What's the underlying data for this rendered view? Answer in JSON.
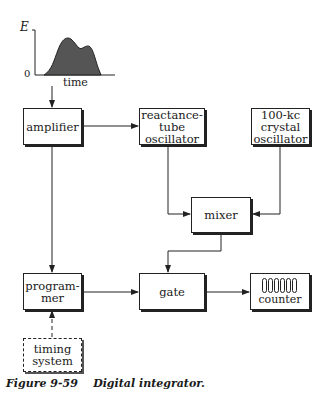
{
  "figure": {
    "caption_number": "Figure 9-59",
    "caption_title": "Digital integrator."
  },
  "input_graph": {
    "y_label": "E",
    "origin_label": "0",
    "x_label": "time",
    "fill_color": "#555555"
  },
  "blocks": {
    "amplifier": "amplifier",
    "reactance_osc": [
      "reactance-",
      "tube",
      "oscillator"
    ],
    "crystal_osc": [
      "100-kc",
      "crystal",
      "oscillator"
    ],
    "mixer": "mixer",
    "programmer": [
      "program-",
      "mer"
    ],
    "gate": "gate",
    "counter": "counter",
    "timing": [
      "timing",
      "system"
    ]
  },
  "counter_digits": 6,
  "connections": [
    {
      "from": "input_graph",
      "to": "amplifier",
      "style": "solid"
    },
    {
      "from": "amplifier",
      "to": "reactance_osc",
      "style": "solid"
    },
    {
      "from": "amplifier",
      "to": "programmer",
      "style": "solid"
    },
    {
      "from": "reactance_osc",
      "to": "mixer",
      "style": "solid"
    },
    {
      "from": "crystal_osc",
      "to": "mixer",
      "style": "solid"
    },
    {
      "from": "mixer",
      "to": "gate",
      "style": "solid"
    },
    {
      "from": "programmer",
      "to": "gate",
      "style": "solid"
    },
    {
      "from": "gate",
      "to": "counter",
      "style": "solid"
    },
    {
      "from": "timing",
      "to": "programmer",
      "style": "dashed"
    }
  ]
}
